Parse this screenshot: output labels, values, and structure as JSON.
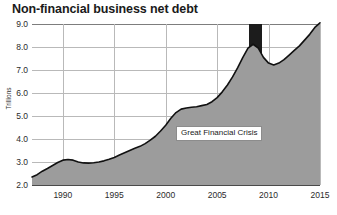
{
  "chart_data": {
    "type": "area",
    "title": "Non-financial business net debt",
    "xlabel": "",
    "ylabel": "Trillions",
    "xlim": [
      1987,
      2015
    ],
    "ylim": [
      2.0,
      9.0
    ],
    "grid": true,
    "legend": null,
    "xticks": [
      "1990",
      "1995",
      "2000",
      "2005",
      "2010",
      "2015"
    ],
    "xtick_values": [
      1990,
      1995,
      2000,
      2005,
      2010,
      2015
    ],
    "yticks": [
      "2.0",
      "3.0",
      "4.0",
      "5.0",
      "6.0",
      "7.0",
      "8.0",
      "9.0"
    ],
    "ytick_values": [
      2.0,
      3.0,
      4.0,
      5.0,
      6.0,
      7.0,
      8.0,
      9.0
    ],
    "series": [
      {
        "name": "Non-financial business net debt",
        "x": [
          1987,
          1987.5,
          1988,
          1988.5,
          1989,
          1989.5,
          1990,
          1990.5,
          1991,
          1991.5,
          1992,
          1992.5,
          1993,
          1993.5,
          1994,
          1994.5,
          1995,
          1995.5,
          1996,
          1996.5,
          1997,
          1997.5,
          1998,
          1998.5,
          1999,
          1999.5,
          2000,
          2000.5,
          2001,
          2001.5,
          2002,
          2002.5,
          2003,
          2003.5,
          2004,
          2004.5,
          2005,
          2005.5,
          2006,
          2006.5,
          2007,
          2007.5,
          2008,
          2008.5,
          2009,
          2009.5,
          2010,
          2010.5,
          2011,
          2011.5,
          2012,
          2012.5,
          2013,
          2013.5,
          2014,
          2014.5,
          2015
        ],
        "values": [
          2.35,
          2.45,
          2.6,
          2.72,
          2.85,
          2.98,
          3.08,
          3.11,
          3.08,
          3.0,
          2.96,
          2.95,
          2.97,
          3.0,
          3.05,
          3.12,
          3.2,
          3.3,
          3.4,
          3.5,
          3.6,
          3.68,
          3.8,
          3.95,
          4.12,
          4.35,
          4.6,
          4.9,
          5.15,
          5.3,
          5.35,
          5.38,
          5.4,
          5.45,
          5.5,
          5.62,
          5.8,
          6.05,
          6.35,
          6.7,
          7.1,
          7.55,
          7.95,
          8.12,
          7.95,
          7.55,
          7.3,
          7.22,
          7.3,
          7.45,
          7.65,
          7.85,
          8.05,
          8.3,
          8.55,
          8.85,
          9.05
        ]
      }
    ],
    "annotations": [
      {
        "text": "Great Financial Crisis",
        "x_start": 2008.1,
        "x_end": 2009.4,
        "type": "shaded-band",
        "band_color": "#1c1c1c",
        "label_x": 2001.0,
        "label_y": 4.25
      }
    ],
    "colors": {
      "fill": "#9c9c9c",
      "line": "#111111",
      "grid": "#b9b9b9",
      "axis": "#4a4a4a",
      "recession_band": "#1c1c1c",
      "background": "#ffffff",
      "text": "#1a1a1a"
    }
  }
}
